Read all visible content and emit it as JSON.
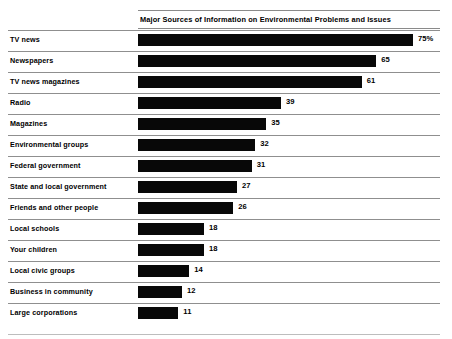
{
  "chart_data": {
    "type": "bar",
    "orientation": "horizontal",
    "title": "Major Sources of Information on Environmental Problems and Issues",
    "subtitle": "",
    "xlabel": "",
    "ylabel": "",
    "xlim": [
      0,
      75
    ],
    "grid": false,
    "legend": null,
    "value_unit": "percent",
    "categories": [
      "TV news",
      "Newspapers",
      "TV news magazines",
      "Radio",
      "Magazines",
      "Environmental groups",
      "Federal government",
      "State and local government",
      "Friends and other people",
      "Local schools",
      "Your children",
      "Local civic groups",
      "Business in community",
      "Large corporations"
    ],
    "values": [
      75,
      65,
      61,
      39,
      35,
      32,
      31,
      27,
      26,
      18,
      18,
      14,
      12,
      11
    ],
    "value_labels": [
      "75%",
      "65",
      "61",
      "39",
      "35",
      "32",
      "31",
      "27",
      "26",
      "18",
      "18",
      "14",
      "12",
      "11"
    ],
    "bar_color": "#080808",
    "rule_color": "#8f8f8f",
    "background": "#ffffff",
    "rows": [
      {
        "label": "TV news",
        "value": 75,
        "value_label": "75%"
      },
      {
        "label": "Newspapers",
        "value": 65,
        "value_label": "65"
      },
      {
        "label": "TV news magazines",
        "value": 61,
        "value_label": "61"
      },
      {
        "label": "Radio",
        "value": 39,
        "value_label": "39"
      },
      {
        "label": "Magazines",
        "value": 35,
        "value_label": "35"
      },
      {
        "label": "Environmental groups",
        "value": 32,
        "value_label": "32"
      },
      {
        "label": "Federal government",
        "value": 31,
        "value_label": "31"
      },
      {
        "label": "State and local government",
        "value": 27,
        "value_label": "27"
      },
      {
        "label": "Friends and other people",
        "value": 26,
        "value_label": "26"
      },
      {
        "label": "Local schools",
        "value": 18,
        "value_label": "18"
      },
      {
        "label": "Your children",
        "value": 18,
        "value_label": "18"
      },
      {
        "label": "Local civic groups",
        "value": 14,
        "value_label": "14"
      },
      {
        "label": "Business in community",
        "value": 12,
        "value_label": "12"
      },
      {
        "label": "Large corporations",
        "value": 11,
        "value_label": "11"
      }
    ]
  },
  "layout": {
    "px_per_unit": 3.667,
    "bar_origin_x": 138,
    "value_gap_px": 5
  }
}
